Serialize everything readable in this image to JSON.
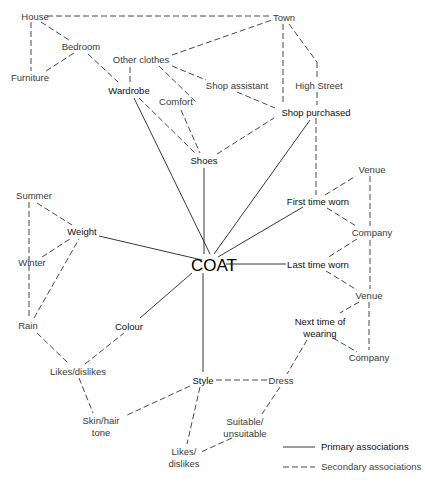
{
  "diagram": {
    "center": {
      "id": "coat",
      "label": "COAT",
      "x": 217,
      "y": 265
    },
    "nodes": [
      {
        "id": "house",
        "label": "House",
        "x": 35,
        "y": 17,
        "type": "secondary"
      },
      {
        "id": "town",
        "label": "Town",
        "x": 289,
        "y": 18,
        "type": "secondary"
      },
      {
        "id": "bedroom",
        "label": "Bedroom",
        "x": 81,
        "y": 47,
        "type": "secondary"
      },
      {
        "id": "other_clothes",
        "label": "Other clothes",
        "x": 141,
        "y": 60,
        "type": "secondary"
      },
      {
        "id": "furniture",
        "label": "Furniture",
        "x": 30,
        "y": 78,
        "type": "secondary"
      },
      {
        "id": "wardrobe",
        "label": "Wardrobe",
        "x": 129,
        "y": 91,
        "type": "primary"
      },
      {
        "id": "shop_assistant",
        "label": "Shop assistant",
        "x": 236,
        "y": 86,
        "type": "secondary"
      },
      {
        "id": "high_street",
        "label": "High Street",
        "x": 318,
        "y": 86,
        "type": "secondary"
      },
      {
        "id": "comfort",
        "label": "Comfort",
        "x": 176,
        "y": 102,
        "type": "secondary"
      },
      {
        "id": "shop_purchased",
        "label": "Shop purchased",
        "x": 316,
        "y": 113,
        "type": "primary"
      },
      {
        "id": "shoes",
        "label": "Shoes",
        "x": 204,
        "y": 161,
        "type": "primary"
      },
      {
        "id": "venue1",
        "label": "Venue",
        "x": 372,
        "y": 170,
        "type": "secondary"
      },
      {
        "id": "summer",
        "label": "Summer",
        "x": 34,
        "y": 196,
        "type": "secondary"
      },
      {
        "id": "first_time_worn",
        "label": "First time worn",
        "x": 318,
        "y": 202,
        "type": "primary"
      },
      {
        "id": "weight",
        "label": "Weight",
        "x": 82,
        "y": 232,
        "type": "primary"
      },
      {
        "id": "company1",
        "label": "Company",
        "x": 372,
        "y": 233,
        "type": "secondary"
      },
      {
        "id": "winter",
        "label": "Winter",
        "x": 32,
        "y": 263,
        "type": "secondary"
      },
      {
        "id": "last_time_worn",
        "label": "Last time worn",
        "x": 318,
        "y": 265,
        "type": "primary"
      },
      {
        "id": "venue2",
        "label": "Venue",
        "x": 369,
        "y": 296,
        "type": "secondary"
      },
      {
        "id": "next_time_1",
        "label": "Next time of",
        "x": 320,
        "y": 322,
        "type": "primary"
      },
      {
        "id": "next_time_2",
        "label": "wearing",
        "x": 320,
        "y": 334,
        "type": "primary"
      },
      {
        "id": "rain",
        "label": "Rain",
        "x": 28,
        "y": 326,
        "type": "secondary"
      },
      {
        "id": "colour",
        "label": "Colour",
        "x": 129,
        "y": 327,
        "type": "primary"
      },
      {
        "id": "likes_dislikes1",
        "label": "Likes/dislikes",
        "x": 78,
        "y": 372,
        "type": "secondary"
      },
      {
        "id": "company2",
        "label": "Company",
        "x": 369,
        "y": 358,
        "type": "secondary"
      },
      {
        "id": "style",
        "label": "Style",
        "x": 203,
        "y": 381,
        "type": "primary"
      },
      {
        "id": "dress",
        "label": "Dress",
        "x": 279,
        "y": 381,
        "type": "secondary"
      },
      {
        "id": "skin_1",
        "label": "Skin/hair",
        "x": 101,
        "y": 421,
        "type": "secondary"
      },
      {
        "id": "skin_2",
        "label": "tone",
        "x": 101,
        "y": 433,
        "type": "secondary"
      },
      {
        "id": "suitable_1",
        "label": "Suitable/",
        "x": 245,
        "y": 422,
        "type": "secondary"
      },
      {
        "id": "suitable_2",
        "label": "unsuitable",
        "x": 245,
        "y": 434,
        "type": "secondary"
      },
      {
        "id": "likes2_1",
        "label": "Likes/",
        "x": 184,
        "y": 452,
        "type": "secondary"
      },
      {
        "id": "likes2_2",
        "label": "dislikes",
        "x": 184,
        "y": 464,
        "type": "secondary"
      }
    ],
    "legend": {
      "primary_label": "Primary associations",
      "secondary_label": "Secondary associations"
    }
  }
}
